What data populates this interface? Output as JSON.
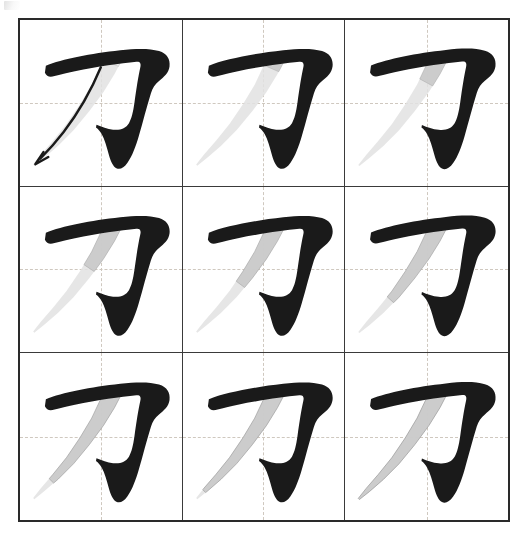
{
  "page": {
    "character": "刀",
    "background_color": "#ffffff"
  },
  "colors": {
    "ink_black": "#1a1a1a",
    "ghost_gray": "#c9c9c9",
    "ghost_gray_light": "#e2e2e2",
    "frame_border": "#2a2a2a",
    "cell_border": "#3a3a3a",
    "guide_dashed": "#cfc8bf",
    "arrow": "#1a1a1a"
  },
  "grid": {
    "rows": 3,
    "columns": 3,
    "frame_left": 18,
    "frame_top": 18,
    "frame_width": 492,
    "frame_height": 504,
    "guides": {
      "horizontal": "center dashed",
      "vertical": "center dashed"
    }
  },
  "artifact": {
    "name": "scan-artifact",
    "description": "faint partial mark at top-left edge"
  },
  "frames": [
    {
      "index": 1,
      "row": 1,
      "col": 1,
      "label": "frame-1",
      "ghost_progress": 0.0,
      "has_arrow": true,
      "arrow_direction": "down-left",
      "description": "first stroke complete, second stroke ghosted with direction arrow"
    },
    {
      "index": 2,
      "row": 1,
      "col": 2,
      "label": "frame-2",
      "ghost_progress": 0.12,
      "has_arrow": false,
      "arrow_direction": "",
      "description": "second stroke beginning"
    },
    {
      "index": 3,
      "row": 1,
      "col": 3,
      "label": "frame-3",
      "ghost_progress": 0.24,
      "has_arrow": false,
      "arrow_direction": "",
      "description": "second stroke advancing"
    },
    {
      "index": 4,
      "row": 2,
      "col": 1,
      "label": "frame-4",
      "ghost_progress": 0.38,
      "has_arrow": false,
      "arrow_direction": "",
      "description": "second stroke mid sweep"
    },
    {
      "index": 5,
      "row": 2,
      "col": 2,
      "label": "frame-5",
      "ghost_progress": 0.5,
      "has_arrow": false,
      "arrow_direction": "",
      "description": "second stroke halfway"
    },
    {
      "index": 6,
      "row": 2,
      "col": 3,
      "label": "frame-6",
      "ghost_progress": 0.62,
      "has_arrow": false,
      "arrow_direction": "",
      "description": "second stroke lengthening"
    },
    {
      "index": 7,
      "row": 3,
      "col": 1,
      "label": "frame-7",
      "ghost_progress": 0.76,
      "has_arrow": false,
      "arrow_direction": "",
      "description": "second stroke extending to lower left"
    },
    {
      "index": 8,
      "row": 3,
      "col": 2,
      "label": "frame-8",
      "ghost_progress": 0.88,
      "has_arrow": false,
      "arrow_direction": "",
      "description": "second stroke nearly finished"
    },
    {
      "index": 9,
      "row": 3,
      "col": 3,
      "label": "frame-9",
      "ghost_progress": 1.0,
      "has_arrow": false,
      "arrow_direction": "",
      "description": "second stroke complete, character finished"
    }
  ]
}
